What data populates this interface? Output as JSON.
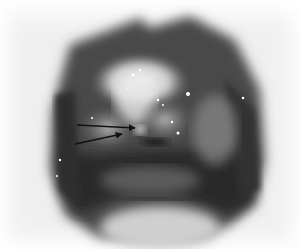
{
  "image": {
    "description": "Grayscale clinical photograph of an opened cavity with two black arrows pointing to a small nodular lesion",
    "colors": {
      "background": "#ffffff",
      "tissue_dark": "#2a2a2a",
      "tissue_mid": "#707070",
      "tissue_light": "#d8d8d8",
      "highlight": "#f4f4f4",
      "arrow": "#111111"
    },
    "arrows": [
      {
        "from": [
          77,
          125
        ],
        "to": [
          135,
          128
        ]
      },
      {
        "from": [
          75,
          144
        ],
        "to": [
          122,
          134
        ]
      }
    ]
  }
}
